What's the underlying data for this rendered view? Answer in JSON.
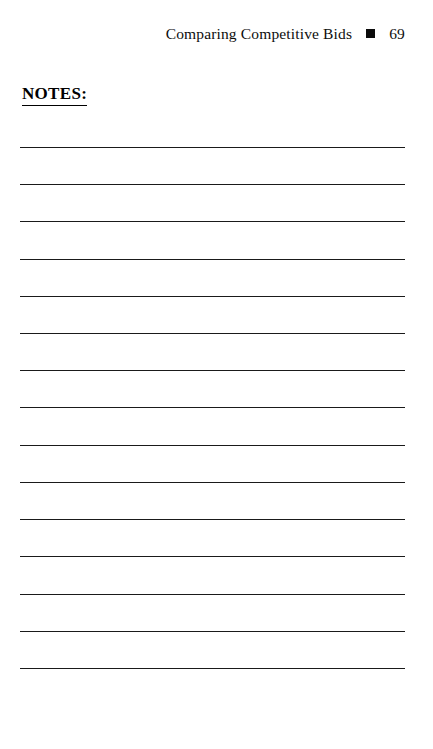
{
  "page": {
    "background_color": "#ffffff",
    "text_color": "#111111",
    "rule_color": "#1a1a1a",
    "width": 433,
    "height": 749
  },
  "header": {
    "chapter_title": "Comparing Competitive Bids",
    "separator_icon": "filled-square-icon",
    "page_number": "69"
  },
  "notes": {
    "heading": "NOTES:",
    "line_count": 15,
    "line_left": 20,
    "line_right": 405,
    "line_positions": [
      147,
      184,
      221,
      259,
      296,
      333,
      370,
      407,
      445,
      482,
      519,
      556,
      594,
      631,
      668
    ],
    "line_values": [
      "",
      "",
      "",
      "",
      "",
      "",
      "",
      "",
      "",
      "",
      "",
      "",
      "",
      "",
      ""
    ]
  }
}
